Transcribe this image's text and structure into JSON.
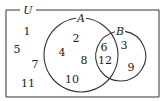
{
  "diagram": {
    "type": "venn",
    "universe_label": "U",
    "sets": [
      {
        "name": "A",
        "label": "A"
      },
      {
        "name": "B",
        "label": "B"
      }
    ],
    "regions": {
      "outside": [
        "1",
        "5",
        "7",
        "11"
      ],
      "A_only": [
        "2",
        "4",
        "8",
        "10"
      ],
      "A_and_B": [
        "6",
        "12"
      ],
      "B_only": [
        "3",
        "9"
      ]
    }
  }
}
